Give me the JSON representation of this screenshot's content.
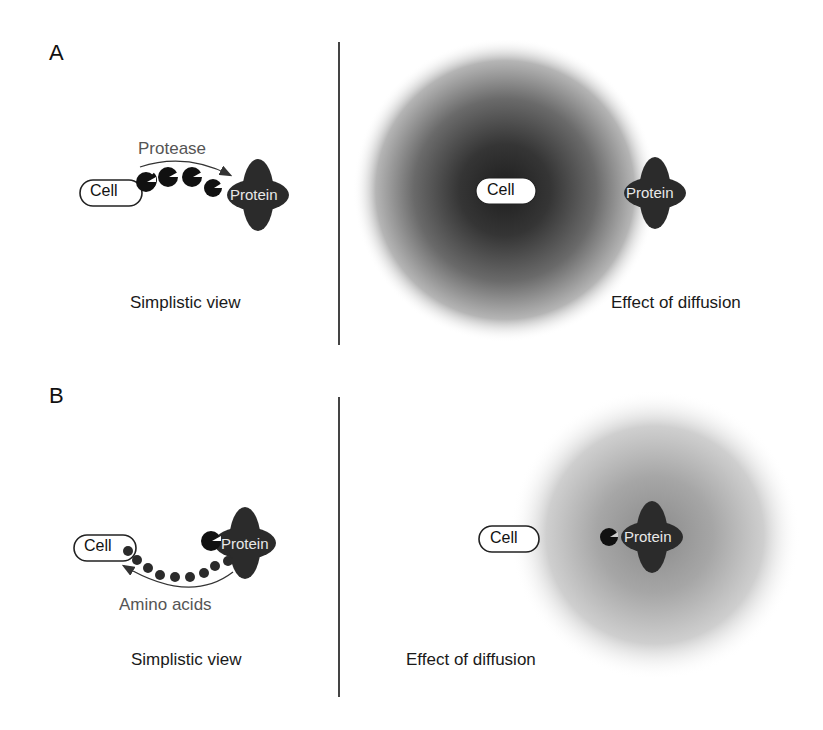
{
  "figure": {
    "panels": [
      {
        "letter": "A",
        "left": {
          "caption": "Simplistic view",
          "cell_label": "Cell",
          "protein_label": "Protein",
          "arrow_label": "Protease",
          "protease_count": 4
        },
        "right": {
          "caption": "Effect of diffusion",
          "cell_label": "Cell",
          "protein_label": "Protein",
          "cloud_center": "Cell",
          "cloud_shade": "#2a2a2a"
        }
      },
      {
        "letter": "B",
        "left": {
          "caption": "Simplistic view",
          "cell_label": "Cell",
          "protein_label": "Protein",
          "arrow_label": "Amino acids",
          "amino_acid_count": 8
        },
        "right": {
          "caption": "Effect of diffusion",
          "cell_label": "Cell",
          "protein_label": "Protein",
          "cloud_center": "Protein",
          "cloud_shade": "#7a7a7a"
        }
      }
    ],
    "colors": {
      "dark_shape": "#2b2b2b",
      "label_text": "#555555",
      "divider": "#444444"
    }
  }
}
